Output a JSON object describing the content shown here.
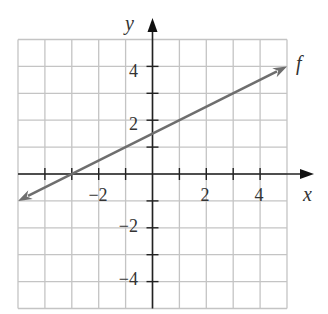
{
  "chart_data": {
    "type": "line",
    "title": "",
    "xlabel": "x",
    "ylabel": "y",
    "xlim": [
      -5,
      5
    ],
    "ylim": [
      -5,
      5
    ],
    "grid": true,
    "x_tick_labels": [
      "-2",
      "2",
      "4"
    ],
    "y_tick_labels": [
      "4",
      "2",
      "-2",
      "-4"
    ],
    "series": [
      {
        "name": "f",
        "x": [
          -5,
          5
        ],
        "y": [
          -1,
          4
        ],
        "slope": 0.5,
        "intercept": 1.5
      }
    ],
    "annotations": [
      "f"
    ]
  },
  "labels": {
    "x_axis": "x",
    "y_axis": "y",
    "function": "f",
    "ticks": {
      "x_m2": "−2",
      "x_2": "2",
      "x_4": "4",
      "y_4": "4",
      "y_2": "2",
      "y_m2": "−2",
      "y_m4": "−4"
    }
  },
  "colors": {
    "grid": "#bdbdbd",
    "axis": "#222222",
    "line": "#6e6e6e"
  }
}
